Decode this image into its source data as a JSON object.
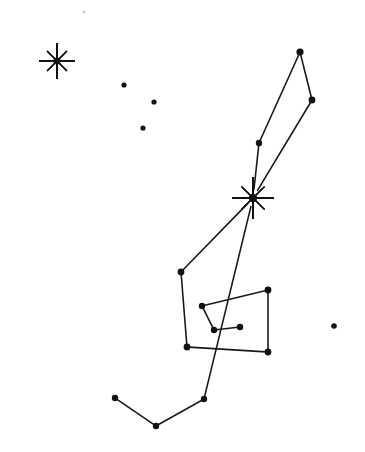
{
  "canvas": {
    "width": 365,
    "height": 452,
    "background_color": "#ffffff",
    "ink_color": "#111111",
    "line_color": "#1a1a1a",
    "title": "Constellation Star Map"
  },
  "chart_data": {
    "type": "scatter",
    "xlabel": "",
    "ylabel": "",
    "xlim": [
      0,
      365
    ],
    "ylim": [
      0,
      452
    ],
    "grid": false,
    "legend": "none",
    "stars": [
      {
        "id": "s1",
        "name": "bright-star-upper-left",
        "x": 57,
        "y": 61,
        "kind": "bright",
        "radius": 18,
        "rays": 8
      },
      {
        "id": "s2",
        "name": "bright-star-center",
        "x": 253,
        "y": 198,
        "kind": "bright",
        "radius": 21,
        "rays": 8
      },
      {
        "id": "s3",
        "name": "star-top-apex",
        "x": 300,
        "y": 52,
        "kind": "dot",
        "radius": 3.6
      },
      {
        "id": "s4",
        "name": "star-upper-right",
        "x": 312,
        "y": 100,
        "kind": "dot",
        "radius": 3.4
      },
      {
        "id": "s5",
        "name": "star-mid-upper",
        "x": 259,
        "y": 143,
        "kind": "dot",
        "radius": 3.2
      },
      {
        "id": "s6",
        "name": "star-shoulder-left",
        "x": 181,
        "y": 272,
        "kind": "dot",
        "radius": 3.4
      },
      {
        "id": "s7",
        "name": "star-belt-right-top",
        "x": 268,
        "y": 290,
        "kind": "dot",
        "radius": 3.4
      },
      {
        "id": "s8",
        "name": "star-belt-right-bottom",
        "x": 268,
        "y": 352,
        "kind": "dot",
        "radius": 3.4
      },
      {
        "id": "s9",
        "name": "star-belt-left-bottom",
        "x": 187,
        "y": 347,
        "kind": "dot",
        "radius": 3.4
      },
      {
        "id": "s10",
        "name": "star-inner-upper",
        "x": 202,
        "y": 306,
        "kind": "dot",
        "radius": 3.2
      },
      {
        "id": "s11",
        "name": "star-inner-lower",
        "x": 214,
        "y": 330,
        "kind": "dot",
        "radius": 3.2
      },
      {
        "id": "s12",
        "name": "star-inner-right",
        "x": 240,
        "y": 327,
        "kind": "dot",
        "radius": 3.2
      },
      {
        "id": "s13",
        "name": "star-foot-left",
        "x": 115,
        "y": 398,
        "kind": "dot",
        "radius": 3.2
      },
      {
        "id": "s14",
        "name": "star-foot-bottom",
        "x": 156,
        "y": 426,
        "kind": "dot",
        "radius": 3.2
      },
      {
        "id": "s15",
        "name": "star-foot-right",
        "x": 204,
        "y": 399,
        "kind": "dot",
        "radius": 3.2
      },
      {
        "id": "s16",
        "name": "star-scatter-upper-a",
        "x": 124,
        "y": 85,
        "kind": "dot",
        "radius": 2.6
      },
      {
        "id": "s17",
        "name": "star-scatter-upper-b",
        "x": 154,
        "y": 102,
        "kind": "dot",
        "radius": 2.6
      },
      {
        "id": "s18",
        "name": "star-scatter-upper-c",
        "x": 143,
        "y": 128,
        "kind": "dot",
        "radius": 2.6
      },
      {
        "id": "s19",
        "name": "star-isolated-right",
        "x": 334,
        "y": 326,
        "kind": "dot",
        "radius": 2.8
      },
      {
        "id": "s20",
        "name": "speck-top",
        "x": 84,
        "y": 12,
        "kind": "speck",
        "radius": 1.6
      }
    ],
    "connections": [
      {
        "name": "line-apex-to-upper-right",
        "from": "s3",
        "to": "s4"
      },
      {
        "name": "line-apex-to-mid-upper",
        "from": "s3",
        "to": "s5"
      },
      {
        "name": "line-mid-upper-to-center",
        "from": "s5",
        "to": "s2"
      },
      {
        "name": "line-upper-right-to-center",
        "from": "s4",
        "to": "s2"
      },
      {
        "name": "line-center-to-shoulder",
        "from": "s2",
        "to": "s6"
      },
      {
        "name": "line-center-to-foot-right",
        "from": "s2",
        "to": "s15"
      },
      {
        "name": "line-shoulder-to-belt-left",
        "from": "s6",
        "to": "s9"
      },
      {
        "name": "line-belt-left-to-belt-right",
        "from": "s9",
        "to": "s8"
      },
      {
        "name": "line-belt-right-vertical",
        "from": "s7",
        "to": "s8"
      },
      {
        "name": "line-inner-upper-to-belt-right-top",
        "from": "s10",
        "to": "s7"
      },
      {
        "name": "line-inner-upper-to-inner-lower",
        "from": "s10",
        "to": "s11"
      },
      {
        "name": "line-inner-lower-to-inner-right",
        "from": "s11",
        "to": "s12"
      },
      {
        "name": "line-foot-left-to-foot-bottom",
        "from": "s13",
        "to": "s14"
      },
      {
        "name": "line-foot-bottom-to-foot-right",
        "from": "s14",
        "to": "s15"
      }
    ]
  }
}
